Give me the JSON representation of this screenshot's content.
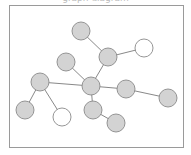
{
  "caption": "graph diagram",
  "colors": {
    "frame": "#9a9a9a",
    "edge": "#7a7a7a",
    "node_stroke": "#8a8a8a",
    "node_fill_gray": "#d3d3d3",
    "node_fill_white": "#ffffff"
  },
  "frame": {
    "x": 9,
    "y": 5,
    "w": 174,
    "h": 142
  },
  "node_radius": 9,
  "nodes": [
    {
      "id": "n1",
      "x": 81,
      "y": 31,
      "fill": "gray"
    },
    {
      "id": "n2",
      "x": 108,
      "y": 57,
      "fill": "gray"
    },
    {
      "id": "n3",
      "x": 144,
      "y": 48,
      "fill": "white"
    },
    {
      "id": "n4",
      "x": 66,
      "y": 62,
      "fill": "gray"
    },
    {
      "id": "n5",
      "x": 91,
      "y": 86,
      "fill": "gray"
    },
    {
      "id": "n6",
      "x": 40,
      "y": 82,
      "fill": "gray"
    },
    {
      "id": "n7",
      "x": 126,
      "y": 89,
      "fill": "gray"
    },
    {
      "id": "n8",
      "x": 168,
      "y": 98,
      "fill": "gray"
    },
    {
      "id": "n9",
      "x": 25,
      "y": 110,
      "fill": "gray"
    },
    {
      "id": "n10",
      "x": 62,
      "y": 117,
      "fill": "white"
    },
    {
      "id": "n11",
      "x": 93,
      "y": 110,
      "fill": "gray"
    },
    {
      "id": "n12",
      "x": 116,
      "y": 123,
      "fill": "gray"
    }
  ],
  "edges": [
    [
      "n1",
      "n2"
    ],
    [
      "n2",
      "n3"
    ],
    [
      "n2",
      "n5"
    ],
    [
      "n4",
      "n5"
    ],
    [
      "n6",
      "n5"
    ],
    [
      "n5",
      "n7"
    ],
    [
      "n7",
      "n8"
    ],
    [
      "n6",
      "n9"
    ],
    [
      "n6",
      "n10"
    ],
    [
      "n5",
      "n11"
    ],
    [
      "n11",
      "n12"
    ]
  ]
}
